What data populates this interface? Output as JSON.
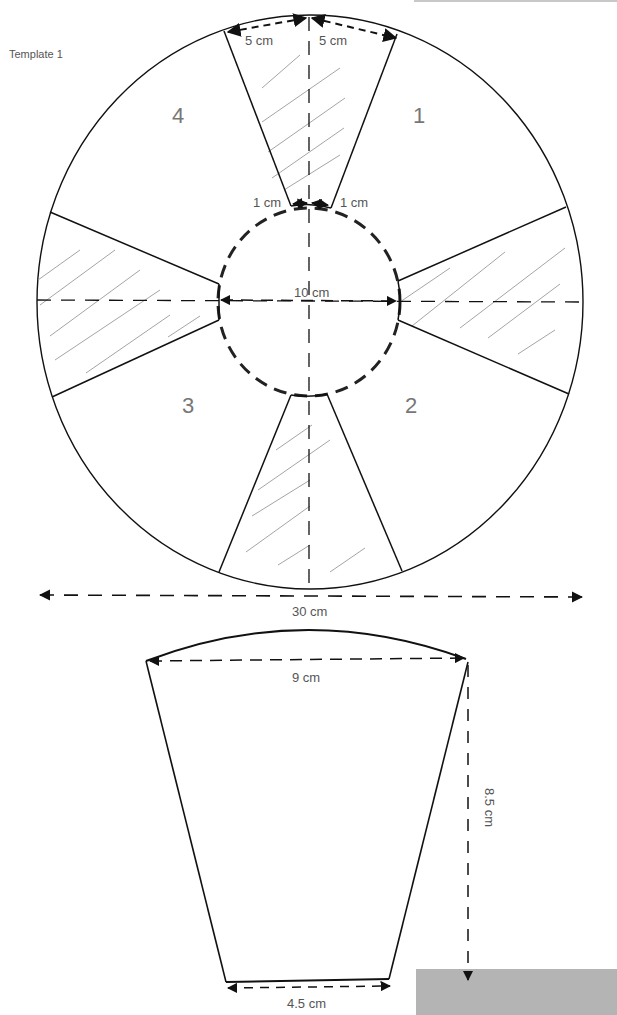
{
  "title": "Template 1",
  "segments": [
    "1",
    "2",
    "3",
    "4"
  ],
  "dimensions": {
    "top_left_arc": "5 cm",
    "top_right_arc": "5 cm",
    "inner_left": "1 cm",
    "inner_right": "1 cm",
    "inner_diameter": "10 cm",
    "outer_diameter": "30 cm",
    "trap_top": "9 cm",
    "trap_height": "8.5 cm",
    "trap_bottom": "4.5 cm"
  },
  "colors": {
    "line": "#111111",
    "hatch": "#9a9a9a",
    "text": "#555555",
    "gray_box": "#b4b4b4"
  }
}
